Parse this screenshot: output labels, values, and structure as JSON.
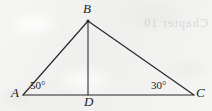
{
  "figure": {
    "type": "geometry-diagram",
    "background_color": "#f3f3f1",
    "stroke_color": "#26262a",
    "canvas": {
      "width": 212,
      "height": 111
    },
    "points": {
      "A": {
        "x": 23,
        "y": 95,
        "label": "A",
        "label_x": 11,
        "label_y": 85
      },
      "B": {
        "x": 88,
        "y": 21,
        "label": "B",
        "label_x": 83,
        "label_y": 1
      },
      "C": {
        "x": 194,
        "y": 95,
        "label": "C",
        "label_x": 196,
        "label_y": 85
      },
      "D": {
        "x": 88,
        "y": 95,
        "label": "D",
        "label_x": 84,
        "label_y": 94
      }
    },
    "segments": [
      {
        "name": "AC",
        "from": "A",
        "to": "C"
      },
      {
        "name": "AB",
        "from": "A",
        "to": "B"
      },
      {
        "name": "BC",
        "from": "B",
        "to": "C"
      },
      {
        "name": "BD",
        "from": "B",
        "to": "D"
      }
    ],
    "angles": [
      {
        "name": "angle-A",
        "at": "A",
        "value": "50°",
        "label_x": 30,
        "label_y": 79
      },
      {
        "name": "angle-C",
        "at": "C",
        "value": "30°",
        "label_x": 151,
        "label_y": 79
      }
    ],
    "ghost_text": "Chapter 10"
  }
}
